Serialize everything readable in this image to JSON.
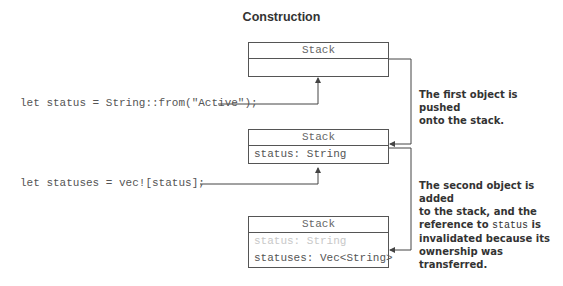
{
  "title": "Construction",
  "boxes": [
    {
      "header": "Stack",
      "rows": []
    },
    {
      "header": "Stack",
      "rows": [
        {
          "text": "status: String",
          "faded": false
        }
      ]
    },
    {
      "header": "Stack",
      "rows": [
        {
          "text": "status: String",
          "faded": true
        },
        {
          "text": "statuses: Vec<String>",
          "faded": false
        }
      ]
    }
  ],
  "code": [
    "let status = String::from(\"Active\");",
    "let statuses = vec![status];"
  ],
  "notes": [
    {
      "lines": [
        "The first object is pushed",
        "onto the stack."
      ]
    },
    {
      "line1": "The second object is added",
      "line2": "to the stack, and the",
      "line3_pre": "reference to ",
      "line3_code": "status",
      "line3_post": " is",
      "line4": "invalidated because its",
      "line5": "ownership was transferred."
    }
  ]
}
